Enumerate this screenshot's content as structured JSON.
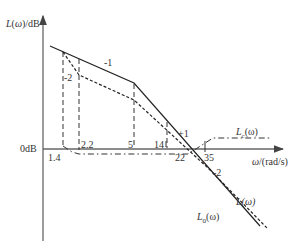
{
  "diagram": {
    "type": "bode_asymptotic_magnitude",
    "y_axis_label": "L(ω)/dB",
    "x_axis_label": "ω/(rad/s)",
    "zero_db_label": "0dB",
    "curves": [
      {
        "name": "L0(ω)",
        "label_main": "L",
        "label_sub": "0",
        "label_tail": "(ω)",
        "style": "solid"
      },
      {
        "name": "L(ω)",
        "label": "L(ω)",
        "style": "dashed"
      },
      {
        "name": "Lc(ω)",
        "label_main": "L",
        "label_sub": "c",
        "label_tail": "(ω)",
        "style": "dash-dot"
      }
    ],
    "frequency_marks": [
      "1.4",
      "2.2",
      "5",
      "14",
      "22",
      "35"
    ],
    "slope_labels": [
      "-1",
      "-2",
      "+1",
      "-2"
    ],
    "colors": {
      "line": "#222222",
      "axis": "#555555",
      "text": "#333333"
    }
  }
}
